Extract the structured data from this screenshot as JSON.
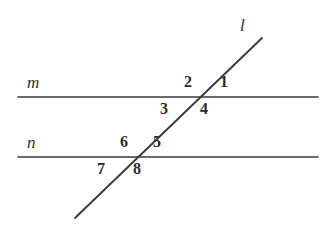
{
  "figure": {
    "type": "geometry-diagram",
    "background_color": "#ffffff",
    "stroke_color": "#3a3a3a"
  },
  "lines": [
    {
      "id": "m",
      "label": "m",
      "kind": "horizontal",
      "x1": 18,
      "y1": 97,
      "x2": 318,
      "y2": 97,
      "label_x": 27,
      "label_y": 74
    },
    {
      "id": "n",
      "label": "n",
      "kind": "horizontal",
      "x1": 18,
      "y1": 157,
      "x2": 318,
      "y2": 157,
      "label_x": 27,
      "label_y": 134
    },
    {
      "id": "l",
      "label": "l",
      "kind": "transversal",
      "x1": 75,
      "y1": 218,
      "x2": 262,
      "y2": 38,
      "label_x": 240,
      "label_y": 17
    }
  ],
  "intersections": [
    {
      "id": "m-l",
      "x": 200,
      "y": 97
    },
    {
      "id": "n-l",
      "x": 133,
      "y": 157
    }
  ],
  "angles": [
    {
      "id": "angle-1",
      "label": "1",
      "x": 220,
      "y": 74,
      "at": "m-l",
      "position": "upper-right"
    },
    {
      "id": "angle-2",
      "label": "2",
      "x": 184,
      "y": 74,
      "at": "m-l",
      "position": "upper-left"
    },
    {
      "id": "angle-3",
      "label": "3",
      "x": 160,
      "y": 101,
      "at": "m-l",
      "position": "lower-left"
    },
    {
      "id": "angle-4",
      "label": "4",
      "x": 200,
      "y": 101,
      "at": "m-l",
      "position": "lower-right"
    },
    {
      "id": "angle-5",
      "label": "5",
      "x": 153,
      "y": 134,
      "at": "n-l",
      "position": "upper-right"
    },
    {
      "id": "angle-6",
      "label": "6",
      "x": 120,
      "y": 134,
      "at": "n-l",
      "position": "upper-left"
    },
    {
      "id": "angle-7",
      "label": "7",
      "x": 97,
      "y": 161,
      "at": "n-l",
      "position": "lower-left"
    },
    {
      "id": "angle-8",
      "label": "8",
      "x": 133,
      "y": 161,
      "at": "n-l",
      "position": "lower-right"
    }
  ]
}
